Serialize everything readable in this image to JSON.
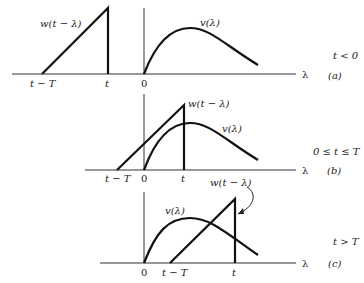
{
  "panels": [
    {
      "id": "a",
      "tag": "(a)",
      "condition": "t < 0",
      "w_label": "w(t − λ)",
      "v_label": "v(λ)",
      "axis_label": "λ",
      "ticks": {
        "t_minus_T": "t − T",
        "t": "t",
        "zero": "0"
      }
    },
    {
      "id": "b",
      "tag": "(b)",
      "condition": "0 ≤ t ≤ T",
      "w_label": "w(t − λ)",
      "v_label": "v(λ)",
      "axis_label": "λ",
      "ticks": {
        "t_minus_T": "t − T",
        "zero": "0",
        "t": "t"
      }
    },
    {
      "id": "c",
      "tag": "(c)",
      "condition": "t > T",
      "w_label": "w(t − λ)",
      "v_label": "v(λ)",
      "axis_label": "λ",
      "ticks": {
        "zero": "0",
        "t_minus_T": "t − T",
        "t": "t"
      }
    }
  ]
}
